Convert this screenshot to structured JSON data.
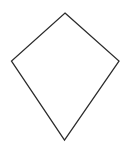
{
  "diagram": {
    "shape": "kite",
    "background": "#ffffff",
    "stroke_color": "#2b2b2b",
    "fill_color": "none",
    "stroke_width": 1.3,
    "vertices": {
      "top": [
        65,
        13
      ],
      "right": [
        119,
        61
      ],
      "bottom": [
        64.5,
        140
      ],
      "left": [
        11.5,
        61
      ]
    },
    "points": "65,13 119,61 64.5,140 11.5,61"
  }
}
